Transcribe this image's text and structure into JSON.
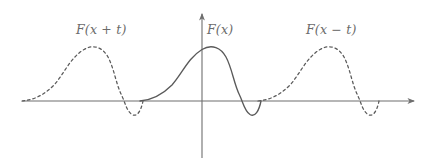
{
  "figure": {
    "kind": "math-plot",
    "background_color": "#ffffff",
    "axis_color": "#6e6e6e",
    "curve_color": "#5a5a5a",
    "label_color": "#6b6b6b",
    "labels": [
      {
        "id": "left",
        "text": "F(x + t)",
        "x": 76,
        "y": 22
      },
      {
        "id": "center",
        "text": "F(x)",
        "x": 207,
        "y": 22
      },
      {
        "id": "right",
        "text": "F(x − t)",
        "x": 306,
        "y": 22
      }
    ]
  },
  "chart_data": {
    "type": "line",
    "title": "",
    "xlabel": "",
    "ylabel": "",
    "grid": false,
    "legend": "none",
    "axes": {
      "origin_px": [
        202,
        101
      ],
      "x_axis_px": {
        "x_start": 22,
        "x_end": 416,
        "y": 101,
        "arrow_end": "right"
      },
      "y_axis_px": {
        "x": 202,
        "y_start": 158,
        "y_end": 12,
        "arrow_end": "up"
      },
      "xlim": [
        -1.52,
        1.82
      ],
      "ylim": [
        -0.45,
        1.15
      ]
    },
    "waveform": {
      "description": "Single pulse F: broad positive hump followed by a shallow negative dip, zero outside its support.",
      "period_px": 118,
      "peak_height_px": 52,
      "trough_depth_px": 15,
      "hump_width_px": 78,
      "dip_width_px": 40
    },
    "series": [
      {
        "name": "F(x + t)",
        "style": "dashed",
        "color": "#5a5a5a",
        "shift_px": -118,
        "x_start_px": 22,
        "x_end_px": 143,
        "peak_x_px": 84,
        "peak_y_px": 49,
        "trough_x_px": 125,
        "trough_y_px": 116,
        "points": [
          [
            22,
            101
          ],
          [
            32,
            99
          ],
          [
            42,
            94
          ],
          [
            52,
            86
          ],
          [
            62,
            75
          ],
          [
            72,
            61
          ],
          [
            84,
            49
          ],
          [
            96,
            47
          ],
          [
            106,
            55
          ],
          [
            114,
            72
          ],
          [
            120,
            90
          ],
          [
            124,
            101
          ],
          [
            128,
            110
          ],
          [
            134,
            115
          ],
          [
            140,
            109
          ],
          [
            143,
            101
          ]
        ]
      },
      {
        "name": "F(x)",
        "style": "solid",
        "color": "#5a5a5a",
        "shift_px": 0,
        "x_start_px": 140,
        "x_end_px": 261,
        "peak_x_px": 202,
        "peak_y_px": 49,
        "trough_x_px": 243,
        "trough_y_px": 116,
        "points": [
          [
            140,
            101
          ],
          [
            150,
            99
          ],
          [
            160,
            94
          ],
          [
            170,
            86
          ],
          [
            180,
            75
          ],
          [
            190,
            61
          ],
          [
            202,
            49
          ],
          [
            214,
            47
          ],
          [
            224,
            55
          ],
          [
            232,
            72
          ],
          [
            238,
            90
          ],
          [
            242,
            101
          ],
          [
            246,
            110
          ],
          [
            252,
            115
          ],
          [
            258,
            109
          ],
          [
            261,
            101
          ]
        ]
      },
      {
        "name": "F(x − t)",
        "style": "dashed",
        "color": "#5a5a5a",
        "shift_px": 118,
        "x_start_px": 258,
        "x_end_px": 379,
        "peak_x_px": 320,
        "peak_y_px": 49,
        "trough_x_px": 361,
        "trough_y_px": 116,
        "points": [
          [
            258,
            101
          ],
          [
            268,
            99
          ],
          [
            278,
            94
          ],
          [
            288,
            86
          ],
          [
            298,
            75
          ],
          [
            308,
            61
          ],
          [
            320,
            49
          ],
          [
            332,
            47
          ],
          [
            342,
            55
          ],
          [
            350,
            72
          ],
          [
            356,
            90
          ],
          [
            360,
            101
          ],
          [
            364,
            110
          ],
          [
            370,
            115
          ],
          [
            376,
            109
          ],
          [
            379,
            101
          ]
        ]
      }
    ]
  }
}
